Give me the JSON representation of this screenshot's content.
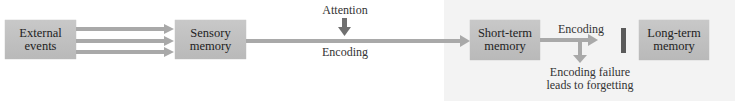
{
  "diagram": {
    "nodes": {
      "external_events": "External events",
      "sensory_memory": "Sensory memory",
      "short_term_memory": "Short-term memory",
      "long_term_memory": "Long-term memory"
    },
    "labels": {
      "attention": "Attention",
      "encoding_1": "Encoding",
      "encoding_2": "Encoding",
      "failure_line1": "Encoding failure",
      "failure_line2": "leads to forgetting"
    },
    "colors": {
      "box": "#bdbdbd",
      "arrow": "#a6a6a6",
      "attention_arrow": "#777777",
      "barrier": "#5a5a5a",
      "shaded_region": "#f3f3f3"
    }
  }
}
